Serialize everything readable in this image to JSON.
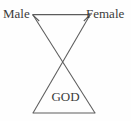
{
  "diagram": {
    "type": "relationship-triad-diagram",
    "background_color": "#fefefe",
    "line_color": "#5c5c5c",
    "text_color": "#3b3b3b",
    "nodes": [
      {
        "id": "male",
        "label": "Male",
        "position": "top-left"
      },
      {
        "id": "female",
        "label": "Female",
        "position": "top-right"
      },
      {
        "id": "god",
        "label": "GOD",
        "position": "bottom-center"
      }
    ],
    "connections": [
      {
        "id": "male-female",
        "from": "male",
        "to": "female",
        "style": "double-headed-arrow",
        "orientation": "horizontal"
      },
      {
        "id": "male-god",
        "from": "male",
        "to": "god",
        "style": "line",
        "orientation": "diagonal"
      },
      {
        "id": "female-god",
        "from": "female",
        "to": "god",
        "style": "line",
        "orientation": "diagonal"
      }
    ],
    "shapes": {
      "crossing_point": {
        "x": 64,
        "y": 64
      },
      "top_left_vertex": {
        "x": 33,
        "y": 15
      },
      "top_right_vertex": {
        "x": 90,
        "y": 15
      },
      "bottom_left_vertex": {
        "x": 33,
        "y": 113
      },
      "bottom_right_vertex": {
        "x": 95,
        "y": 113
      }
    }
  }
}
